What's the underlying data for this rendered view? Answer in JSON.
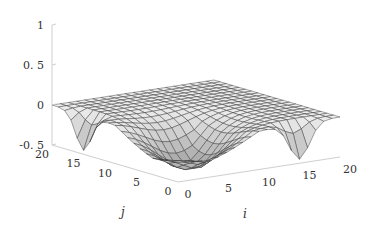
{
  "chart_data": {
    "type": "surface",
    "title": "",
    "xlabel": "i",
    "ylabel": "j",
    "zlabel": "",
    "x_ticks": [
      "0",
      "5",
      "10",
      "15",
      "20"
    ],
    "y_ticks": [
      "0",
      "5",
      "10",
      "15",
      "20"
    ],
    "z_ticks": [
      "-0.5",
      "0",
      "0.5",
      "1"
    ],
    "xlim": [
      0,
      20
    ],
    "ylim": [
      0,
      20
    ],
    "zlim": [
      -0.5,
      1
    ],
    "grid_size": 21,
    "features": [
      {
        "type": "dip",
        "i": 0,
        "j": 15,
        "z": -0.45
      },
      {
        "type": "dip",
        "i": 15,
        "j": 0,
        "z": -0.45
      },
      {
        "type": "dip",
        "i": 6,
        "j": 6,
        "z": -0.4
      },
      {
        "type": "flat_plateau",
        "z": 0.0
      }
    ],
    "colors": {
      "surface_light": "#f2f2f2",
      "surface_dark": "#a8a8a8",
      "mesh": "#333333",
      "axis": "#cfcfcf"
    }
  }
}
